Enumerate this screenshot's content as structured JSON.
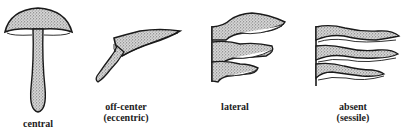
{
  "diagram": {
    "items": [
      {
        "id": "central",
        "label_line1": "central",
        "label_line2": ""
      },
      {
        "id": "eccentric",
        "label_line1": "off-center",
        "label_line2": "(eccentric)"
      },
      {
        "id": "lateral",
        "label_line1": "lateral",
        "label_line2": ""
      },
      {
        "id": "sessile",
        "label_line1": "absent",
        "label_line2": "(sessile)"
      }
    ]
  },
  "colors": {
    "ink": "#1a1a1a",
    "stipple": "#6e6e6e",
    "background": "#ffffff"
  }
}
